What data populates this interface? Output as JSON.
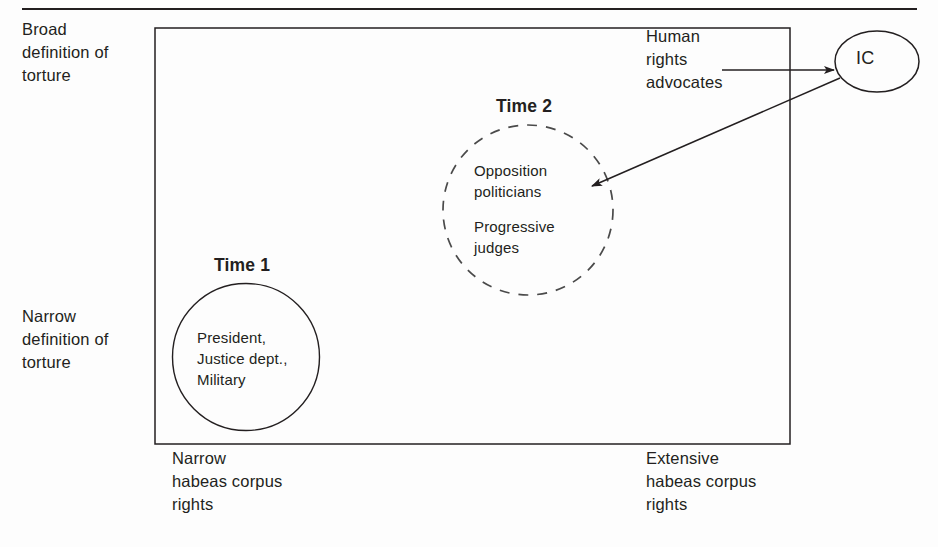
{
  "figure": {
    "type": "two-dimensional-policy-space-diagram",
    "background_color": "#fdfdfd",
    "ink_color": "#231f20"
  },
  "axes": {
    "vertical_top_label": "Broad\ndefinition of\ntorture",
    "vertical_bottom_label": "Narrow\ndefinition of\ntorture",
    "horizontal_left_label": "Narrow\nhabeas corpus\nrights",
    "horizontal_right_label": "Extensive\nhabeas corpus\nrights"
  },
  "clusters": [
    {
      "id": "time1",
      "title": "Time 1",
      "members": "President,\nJustice dept.,\nMilitary",
      "border_style": "solid"
    },
    {
      "id": "time2",
      "title": "Time 2",
      "members_line1": "Opposition\npoliticians",
      "members_line2": "Progressive\njudges",
      "border_style": "dashed"
    }
  ],
  "nodes": [
    {
      "id": "ic",
      "label": "IC",
      "shape": "ellipse"
    }
  ],
  "annotations": {
    "hr_advocates": "Human\nrights\nadvocates"
  },
  "arrows": [
    {
      "id": "advocates-to-ic",
      "from": "Human rights advocates",
      "to": "IC",
      "direction": "right"
    },
    {
      "id": "ic-to-time2",
      "from": "IC",
      "to": "Time 2",
      "direction": "down-left"
    }
  ]
}
